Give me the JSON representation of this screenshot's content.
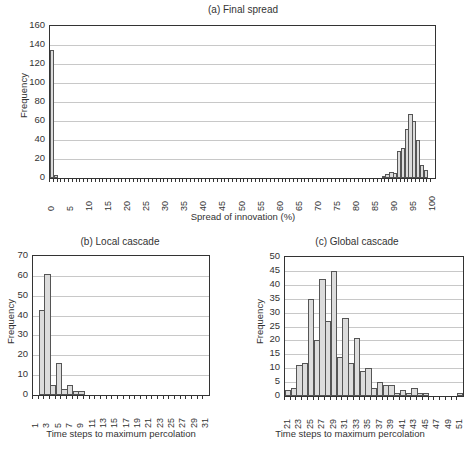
{
  "chart_data": [
    {
      "id": "a",
      "type": "bar",
      "title": "(a) Final spread",
      "xlabel": "Spread of innovation (%)",
      "ylabel": "Frequency",
      "ylim": [
        0,
        160
      ],
      "yticks": [
        0,
        20,
        40,
        60,
        80,
        100,
        120,
        140,
        160
      ],
      "xtick_labels": [
        "0",
        "5",
        "10",
        "15",
        "20",
        "25",
        "30",
        "35",
        "40",
        "45",
        "50",
        "55",
        "60",
        "65",
        "70",
        "75",
        "80",
        "85",
        "90",
        "95",
        "100"
      ],
      "grid": true,
      "bins": {
        "start": 0,
        "end": 100,
        "step": 1
      },
      "nonzero": {
        "0": 135,
        "1": 3,
        "87": 2,
        "88": 4,
        "89": 6,
        "90": 5,
        "91": 28,
        "92": 32,
        "93": 52,
        "94": 67,
        "95": 60,
        "96": 40,
        "97": 14,
        "98": 8
      }
    },
    {
      "id": "b",
      "type": "bar",
      "title": "(b) Local cascade",
      "xlabel": "Time steps to maximum percolation",
      "ylabel": "Frequency",
      "ylim": [
        0,
        70
      ],
      "yticks": [
        0,
        10,
        20,
        30,
        40,
        50,
        60,
        70
      ],
      "xtick_labels": [
        "1",
        "3",
        "5",
        "7",
        "9",
        "11",
        "13",
        "15",
        "17",
        "19",
        "21",
        "23",
        "25",
        "27",
        "29",
        "31"
      ],
      "grid": true,
      "bins": {
        "start": 1,
        "end": 31,
        "step": 1
      },
      "nonzero": {
        "2": 43,
        "3": 61,
        "4": 5,
        "5": 16,
        "6": 3,
        "7": 5,
        "8": 2,
        "9": 2
      }
    },
    {
      "id": "c",
      "type": "bar",
      "title": "(c) Global cascade",
      "xlabel": "Time steps to maximum percolation",
      "ylabel": "Frequency",
      "ylim": [
        0,
        50
      ],
      "yticks": [
        0,
        5,
        10,
        15,
        20,
        25,
        30,
        35,
        40,
        45,
        50
      ],
      "xtick_labels": [
        "21",
        "23",
        "25",
        "27",
        "29",
        "31",
        "33",
        "35",
        "37",
        "39",
        "41",
        "43",
        "45",
        "47",
        "49",
        "51"
      ],
      "grid": true,
      "bins": {
        "start": 21,
        "end": 51,
        "step": 1
      },
      "nonzero": {
        "21": 2,
        "22": 3,
        "23": 11,
        "24": 12,
        "25": 35,
        "26": 20,
        "27": 42,
        "28": 27,
        "29": 45,
        "30": 14,
        "31": 28,
        "32": 12,
        "33": 21,
        "34": 9,
        "35": 10,
        "36": 3,
        "37": 5,
        "38": 4,
        "39": 4,
        "40": 1,
        "41": 2,
        "42": 1,
        "43": 3,
        "44": 1,
        "45": 1,
        "51": 1
      }
    }
  ]
}
